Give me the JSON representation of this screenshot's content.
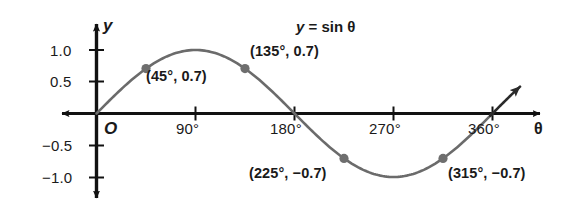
{
  "chart_data": {
    "type": "line",
    "xlabel": "θ",
    "ylabel": "y",
    "origin_label": "O",
    "grid": false,
    "legend": "none",
    "xlim": [
      -10,
      400
    ],
    "ylim": [
      -1.35,
      1.35
    ],
    "x_ticks": [
      {
        "value": 90,
        "label": "90°"
      },
      {
        "value": 180,
        "label": "180°"
      },
      {
        "value": 270,
        "label": "270°"
      },
      {
        "value": 360,
        "label": "360°"
      }
    ],
    "y_ticks": [
      {
        "value": 1.0,
        "label": "1.0"
      },
      {
        "value": 0.5,
        "label": "0.5"
      },
      {
        "value": -0.5,
        "label": "−0.5"
      },
      {
        "value": -1.0,
        "label": "−1.0"
      }
    ],
    "series": [
      {
        "name": "y = sin θ",
        "function": "sin",
        "color": "#6b6b6b",
        "x_start": -20,
        "x_end": 385,
        "arrow_start": true,
        "arrow_end": true
      }
    ],
    "annotated_points": [
      {
        "x": 45,
        "y": 0.7,
        "label": "(45°, 0.7)"
      },
      {
        "x": 135,
        "y": 0.7,
        "label": "(135°, 0.7)"
      },
      {
        "x": 225,
        "y": -0.7,
        "label": "(225°, −0.7)"
      },
      {
        "x": 315,
        "y": -0.7,
        "label": "(315°, −0.7)"
      }
    ],
    "colors": {
      "curve": "#6b6b6b",
      "axis": "#111111",
      "point": "#6e6e6e",
      "text": "#1a1a1a",
      "background": "#ffffff"
    }
  },
  "labels": {
    "y_axis_name": "y",
    "x_axis_name": "θ",
    "origin": "O",
    "equation_lhs": "y",
    "equation_eq": "=",
    "equation_rhs": "sin θ",
    "y_tick_1": "1.0",
    "y_tick_2": "0.5",
    "y_tick_3": "−0.5",
    "y_tick_4": "−1.0",
    "x_tick_1": "90°",
    "x_tick_2": "180°",
    "x_tick_3": "270°",
    "x_tick_4": "360°",
    "point_1": "(45°, 0.7)",
    "point_2": "(135°, 0.7)",
    "point_3": "(225°, −0.7)",
    "point_4": "(315°, −0.7)"
  }
}
